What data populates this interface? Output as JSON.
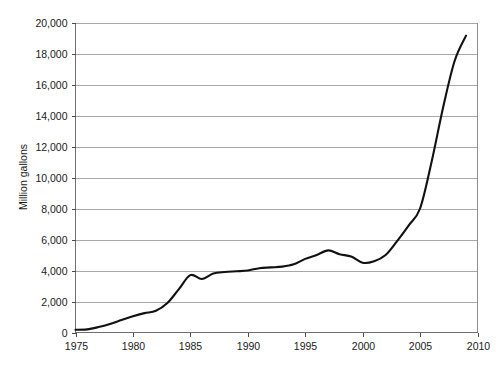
{
  "chart_data": {
    "type": "line",
    "title": "",
    "xlabel": "",
    "ylabel": "Million gallons",
    "xlim": [
      1975,
      2010
    ],
    "ylim": [
      0,
      20000
    ],
    "grid": true,
    "legend": false,
    "x_ticks": [
      "1975",
      "1980",
      "1985",
      "1990",
      "1995",
      "2000",
      "2005",
      "2010"
    ],
    "x_tick_values": [
      1975,
      1980,
      1985,
      1990,
      1995,
      2000,
      2005,
      2010
    ],
    "y_ticks": [
      "0",
      "2,000",
      "4,000",
      "6,000",
      "8,000",
      "10,000",
      "12,000",
      "14,000",
      "16,000",
      "18,000",
      "20,000"
    ],
    "y_tick_values": [
      0,
      2000,
      4000,
      6000,
      8000,
      10000,
      12000,
      14000,
      16000,
      18000,
      20000
    ],
    "series": [
      {
        "name": "Million gallons",
        "color": "#111111",
        "x": [
          1975,
          1976,
          1977,
          1978,
          1979,
          1980,
          1981,
          1982,
          1983,
          1984,
          1985,
          1986,
          1987,
          1988,
          1989,
          1990,
          1991,
          1992,
          1993,
          1994,
          1995,
          1996,
          1997,
          1998,
          1999,
          2000,
          2001,
          2002,
          2003,
          2004,
          2005,
          2006,
          2007,
          2008,
          2009
        ],
        "values": [
          175,
          200,
          350,
          550,
          800,
          1050,
          1250,
          1400,
          1900,
          2800,
          3700,
          3450,
          3800,
          3900,
          3950,
          4000,
          4150,
          4200,
          4250,
          4400,
          4750,
          5000,
          5300,
          5050,
          4900,
          4500,
          4600,
          5000,
          5900,
          6900,
          8000,
          11000,
          14500,
          17500,
          19150
        ]
      }
    ]
  },
  "figure": {
    "caption_fragment": ""
  }
}
